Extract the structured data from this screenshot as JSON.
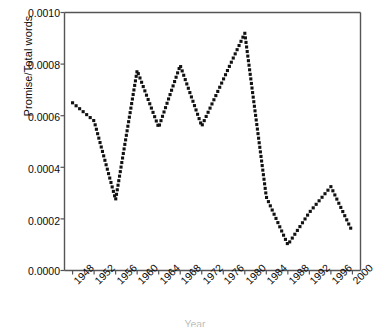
{
  "chart_data": {
    "type": "scatter",
    "title": "",
    "subtitle": "",
    "xlabel": "Year",
    "ylabel": "Promise/Total words",
    "xlim": [
      1946.5,
      2001.5
    ],
    "ylim": [
      0.0,
      0.001
    ],
    "grid": false,
    "legend": null,
    "marker": "small filled square dots forming a dense dotted line",
    "series_color": "#111111",
    "axis_color": "#555555",
    "y_ticks": [
      0.0,
      0.0002,
      0.0004,
      0.0006,
      0.0008,
      0.001
    ],
    "y_tick_labels": [
      "0.0000",
      "0.0002",
      "0.0004",
      "0.0006",
      "0.0008",
      "0.0010"
    ],
    "x_ticks": [
      1948,
      1952,
      1956,
      1960,
      1964,
      1968,
      1972,
      1976,
      1980,
      1984,
      1988,
      1992,
      1996,
      2000
    ],
    "x_tick_labels": [
      "1948",
      "1952",
      "1956",
      "1960",
      "1964",
      "1968",
      "1972",
      "1976",
      "1980",
      "1984",
      "1988",
      "1992",
      "1996",
      "2000"
    ],
    "categories": [
      1948,
      1952,
      1956,
      1960,
      1964,
      1968,
      1972,
      1976,
      1980,
      1984,
      1988,
      1992,
      1996,
      2000
    ],
    "values": [
      0.00065,
      0.00058,
      0.000275,
      0.000775,
      0.000555,
      0.000795,
      0.00056,
      0.00074,
      0.00092,
      0.000285,
      0.0001,
      0.000225,
      0.000325,
      0.00015
    ],
    "series": [
      {
        "name": "Promise/Total words",
        "x": [
          1948,
          1952,
          1956,
          1960,
          1964,
          1968,
          1972,
          1976,
          1980,
          1984,
          1988,
          1992,
          1996,
          2000
        ],
        "values": [
          0.00065,
          0.00058,
          0.000275,
          0.000775,
          0.000555,
          0.000795,
          0.00056,
          0.00074,
          0.00092,
          0.000285,
          0.0001,
          0.000225,
          0.000325,
          0.00015
        ]
      }
    ],
    "annotations": []
  },
  "axes": {
    "y_axis_name": "y-axis",
    "x_axis_name": "x-axis"
  }
}
